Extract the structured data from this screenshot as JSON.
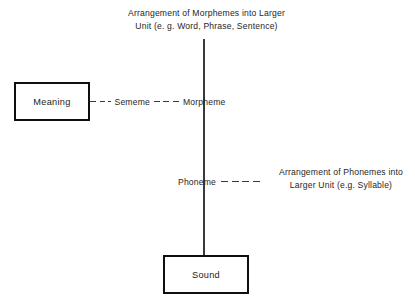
{
  "diagram": {
    "type": "linguistic-structure-hierarchy",
    "background_color": "#ffffff",
    "line_color": "#3a3a3a",
    "box_border_color": "#0f0f0f",
    "text_color": "#262626",
    "captions": {
      "top": {
        "line1": "Arrangement of Morphemes into Larger",
        "line2": "Unit (e. g. Word, Phrase, Sentence)"
      },
      "right": {
        "line1": "Arrangement of Phonemes into",
        "line2": "Larger Unit (e.g. Syllable)"
      }
    },
    "boxes": [
      {
        "id": "meaning",
        "label": "Meaning"
      },
      {
        "id": "sound",
        "label": "Sound"
      }
    ],
    "nodes": [
      {
        "id": "sememe",
        "label": "Sememe"
      },
      {
        "id": "morpheme",
        "label": "Morpheme"
      },
      {
        "id": "phoneme",
        "label": "Phoneme"
      }
    ]
  }
}
